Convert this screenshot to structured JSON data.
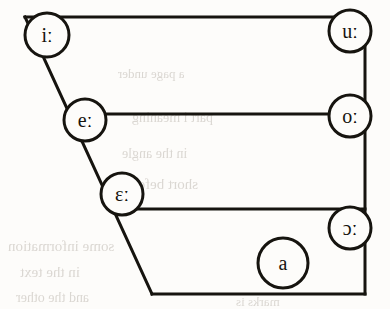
{
  "figure": {
    "ink_color": "#16140f",
    "paper_color": "#fdfcfa",
    "bleed_color": "#b9b3ab"
  },
  "quadrilateral": {
    "name": "vowel-quadrilateral",
    "stroke_width": 3,
    "corners": {
      "top_left": [
        25,
        17
      ],
      "top_right": [
        365,
        17
      ],
      "bottom_right": [
        365,
        294
      ],
      "bottom_left": [
        152,
        294
      ]
    },
    "horizontal_lines": [
      {
        "name": "close-line",
        "y": 17,
        "x1": 25,
        "x2": 365
      },
      {
        "name": "close-mid-line",
        "y": 114,
        "x1": 85,
        "x2": 365
      },
      {
        "name": "open-mid-line",
        "y": 209,
        "x1": 122,
        "x2": 365
      },
      {
        "name": "open-line",
        "y": 294,
        "x1": 152,
        "x2": 365
      }
    ]
  },
  "vowels": [
    {
      "id": "i-long",
      "symbol": "iː",
      "cx": 47,
      "cy": 35,
      "r": 22,
      "font_size": 21
    },
    {
      "id": "u-long",
      "symbol": "uː",
      "cx": 350,
      "cy": 31,
      "r": 21,
      "font_size": 21
    },
    {
      "id": "e-long",
      "symbol": "eː",
      "cx": 85,
      "cy": 120,
      "r": 21,
      "font_size": 21
    },
    {
      "id": "o-long",
      "symbol": "oː",
      "cx": 350,
      "cy": 116,
      "r": 21,
      "font_size": 21
    },
    {
      "id": "epsilon-long",
      "symbol": "ɛː",
      "cx": 122,
      "cy": 194,
      "r": 21,
      "font_size": 21
    },
    {
      "id": "open-o-long",
      "symbol": "ɔː",
      "cx": 350,
      "cy": 228,
      "r": 21,
      "font_size": 21
    },
    {
      "id": "a-open",
      "symbol": "a",
      "cx": 283,
      "cy": 263,
      "r": 25,
      "font_size": 21
    }
  ],
  "bleed_through": [
    {
      "text": "a page under",
      "x": 118,
      "y": 66,
      "size": 13
    },
    {
      "text": "part i meaning",
      "x": 132,
      "y": 110,
      "size": 14
    },
    {
      "text": "in the angle",
      "x": 122,
      "y": 146,
      "size": 14
    },
    {
      "text": "short before",
      "x": 126,
      "y": 176,
      "size": 15
    },
    {
      "text": "some information",
      "x": 8,
      "y": 238,
      "size": 15
    },
    {
      "text": "in the text",
      "x": 20,
      "y": 264,
      "size": 15
    },
    {
      "text": "and the other",
      "x": 16,
      "y": 290,
      "size": 14
    },
    {
      "text": "marks is",
      "x": 236,
      "y": 294,
      "size": 13
    }
  ]
}
